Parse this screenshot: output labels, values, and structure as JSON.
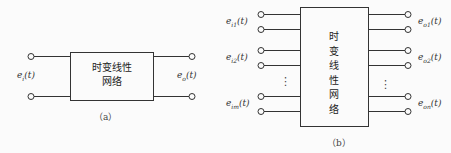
{
  "figure_a": {
    "box_line1": "时变线性",
    "box_line2": "网络",
    "input_label": {
      "base": "e",
      "sub": "i",
      "arg": "(t)"
    },
    "output_label": {
      "base": "e",
      "sub": "o",
      "arg": "(t)"
    },
    "caption": "（a）"
  },
  "figure_b": {
    "box_chars": [
      "时",
      "变",
      "线",
      "性",
      "网",
      "络"
    ],
    "inputs": [
      {
        "base": "e",
        "sub": "i1",
        "arg": "(t)"
      },
      {
        "base": "e",
        "sub": "i2",
        "arg": "(t)"
      },
      {
        "base": "e",
        "sub": "im",
        "arg": "(t)"
      }
    ],
    "outputs": [
      {
        "base": "e",
        "sub": "o1",
        "arg": "(t)"
      },
      {
        "base": "e",
        "sub": "o2",
        "arg": "(t)"
      },
      {
        "base": "e",
        "sub": "on",
        "arg": "(t)"
      }
    ],
    "ellipsis": "⋮",
    "caption": "（b）"
  },
  "colors": {
    "line": "#333333",
    "background": "#fbfbfb"
  }
}
